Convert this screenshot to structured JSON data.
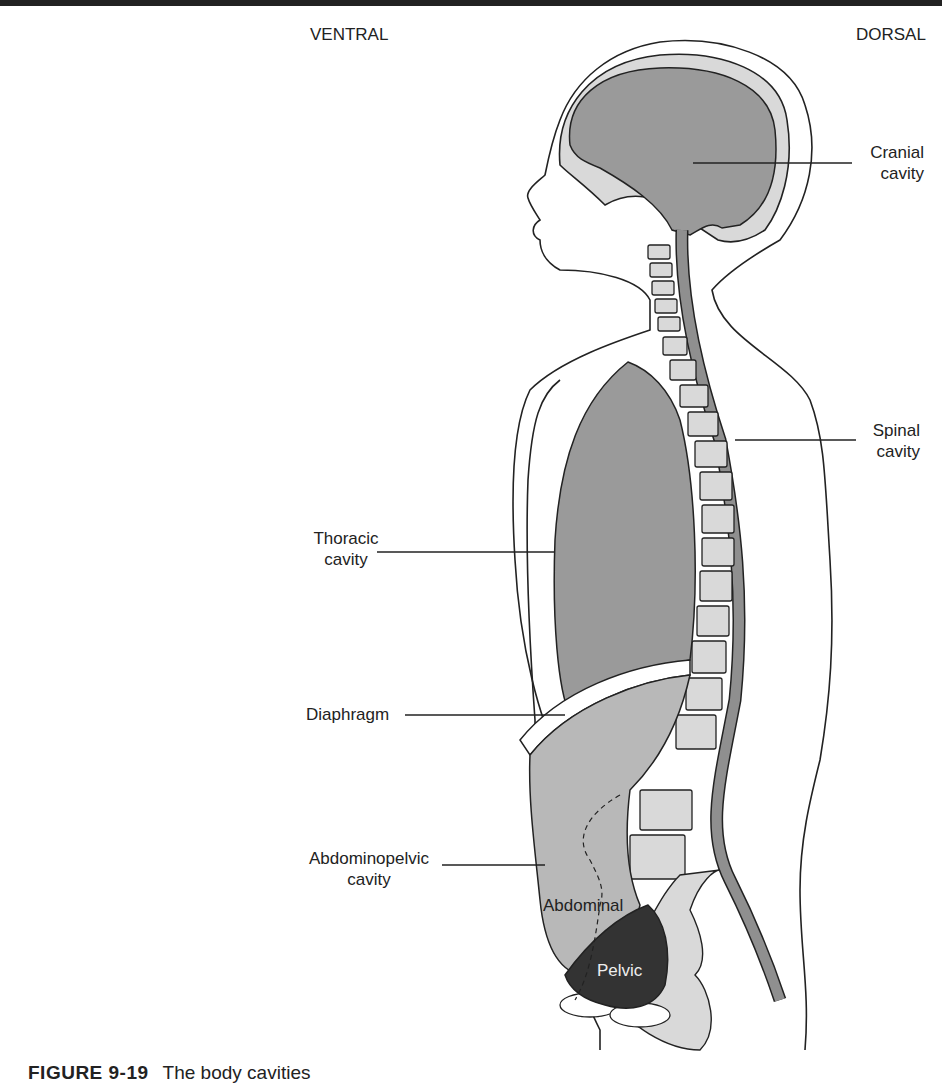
{
  "header": {
    "ventral": "VENTRAL",
    "dorsal": "DORSAL"
  },
  "labels": {
    "cranial": [
      "Cranial",
      "cavity"
    ],
    "spinal": [
      "Spinal",
      "cavity"
    ],
    "thoracic": [
      "Thoracic",
      "cavity"
    ],
    "diaphragm": "Diaphragm",
    "abdominopelvic": [
      "Abdominopelvic",
      "cavity"
    ],
    "abdominal": "Abdominal",
    "pelvic": "Pelvic"
  },
  "caption": {
    "figure": "FIGURE 9-19",
    "text": "The body cavities"
  },
  "colors": {
    "cavity_gray": "#9a9a9a",
    "abdomen_gray": "#b8b8b8",
    "bone_light": "#d9d9d9",
    "pelvic_dark": "#333333",
    "outline": "#222222"
  }
}
